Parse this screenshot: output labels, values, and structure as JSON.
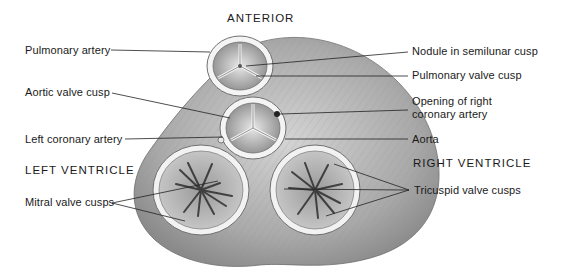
{
  "diagram": {
    "orientation_label": "ANTERIOR",
    "regions": {
      "left_ventricle": "LEFT VENTRICLE",
      "right_ventricle": "RIGHT VENTRICLE"
    },
    "labels_left": {
      "pulmonary_artery": "Pulmonary artery",
      "aortic_valve_cusp": "Aortic valve cusp",
      "left_coronary_artery": "Left coronary artery",
      "mitral_valve_cusps": "Mitral valve cusps"
    },
    "labels_right": {
      "nodule": "Nodule in semilunar cusp",
      "pulmonary_valve_cusp": "Pulmonary valve cusp",
      "opening_rca_line1": "Opening of right",
      "opening_rca_line2": "coronary artery",
      "aorta": "Aorta",
      "tricuspid_valve_cusps": "Tricuspid valve cusps"
    },
    "colors": {
      "background": "#ffffff",
      "tissue": "#b8b8b8",
      "tissue_dark": "#7a7a7a",
      "ring": "#f2f2f2",
      "leader_line": "#222222",
      "text": "#1a1a1a"
    }
  }
}
